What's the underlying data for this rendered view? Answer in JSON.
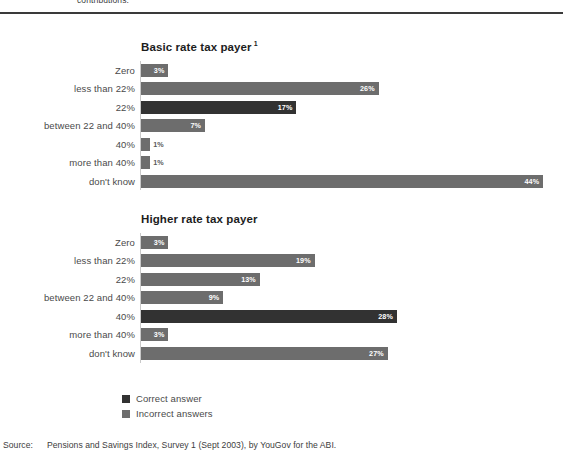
{
  "page": {
    "top_clipped_text": "contributions."
  },
  "legend": {
    "items": [
      {
        "label": "Correct answer",
        "color": "#323232",
        "key": "correct"
      },
      {
        "label": "Incorrect answers",
        "color": "#6d6d6d",
        "key": "incorrect"
      }
    ]
  },
  "source": {
    "label": "Source:",
    "text": "Pensions and Savings Index, Survey 1 (Sept 2003), by YouGov for the ABI."
  },
  "chart_data": [
    {
      "type": "bar",
      "orientation": "horizontal",
      "title": "Basic rate tax payer",
      "title_superscript": "1",
      "xlabel": "",
      "ylabel": "",
      "xlim": [
        0,
        44
      ],
      "grid": false,
      "legend_position": "bottom-left",
      "categories": [
        "Zero",
        "less than 22%",
        "22%",
        "between 22 and 40%",
        "40%",
        "more than 40%",
        "don't know"
      ],
      "values": [
        3,
        26,
        17,
        7,
        1,
        1,
        44
      ],
      "value_labels": [
        "3%",
        "26%",
        "17%",
        "7%",
        "1%",
        "1%",
        "44%"
      ],
      "correct_index": 2,
      "series_name": "Share of respondents (%)"
    },
    {
      "type": "bar",
      "orientation": "horizontal",
      "title": "Higher rate tax payer",
      "title_superscript": "",
      "xlabel": "",
      "ylabel": "",
      "xlim": [
        0,
        44
      ],
      "grid": false,
      "legend_position": "bottom-left",
      "categories": [
        "Zero",
        "less than 22%",
        "22%",
        "between 22 and 40%",
        "40%",
        "more than 40%",
        "don't know"
      ],
      "values": [
        3,
        19,
        13,
        9,
        28,
        3,
        27
      ],
      "value_labels": [
        "3%",
        "19%",
        "13%",
        "9%",
        "28%",
        "3%",
        "27%"
      ],
      "correct_index": 4,
      "series_name": "Share of respondents (%)"
    }
  ]
}
